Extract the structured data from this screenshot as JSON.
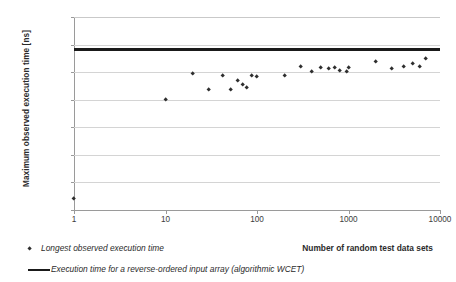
{
  "chart_data": {
    "type": "scatter",
    "title": "",
    "xlabel": "Number of random test data sets",
    "ylabel": "Maximum observed execution time [ns]",
    "xscale": "log",
    "xlim": [
      1,
      10000
    ],
    "ylim": [
      100000,
      240000
    ],
    "ytick_step": 20000,
    "grid": true,
    "legend_position": "bottom-left",
    "xticks": [
      "1",
      "10",
      "100",
      "1000",
      "10000"
    ],
    "xtick_values": [
      1,
      10,
      100,
      1000,
      10000
    ],
    "yticks": [
      "100000",
      "120000",
      "140000",
      "160000",
      "180000",
      "200000",
      "220000",
      "240000"
    ],
    "ytick_values": [
      100000,
      120000,
      140000,
      160000,
      180000,
      200000,
      220000,
      240000
    ],
    "series": [
      {
        "name": "Longest observed execution time",
        "type": "scatter",
        "marker": "diamond",
        "color": "#2e2e2e",
        "points": [
          [
            1,
            108000
          ],
          [
            10,
            179800
          ],
          [
            20,
            198800
          ],
          [
            30,
            187300
          ],
          [
            42,
            197700
          ],
          [
            52,
            187400
          ],
          [
            62,
            193500
          ],
          [
            70,
            191000
          ],
          [
            78,
            188600
          ],
          [
            88,
            197400
          ],
          [
            100,
            196800
          ],
          [
            200,
            197500
          ],
          [
            300,
            203800
          ],
          [
            400,
            200600
          ],
          [
            500,
            203300
          ],
          [
            600,
            202800
          ],
          [
            700,
            203500
          ],
          [
            800,
            201200
          ],
          [
            950,
            200400
          ],
          [
            1000,
            203400
          ],
          [
            2000,
            207500
          ],
          [
            3000,
            202700
          ],
          [
            4000,
            203900
          ],
          [
            5000,
            206200
          ],
          [
            6000,
            203900
          ],
          [
            7000,
            209500
          ]
        ]
      },
      {
        "name": "Execution time for a reverse-ordered input array (algorithmic WCET)",
        "type": "hline",
        "color": "#1a1a1a",
        "value": 216500
      }
    ]
  },
  "legend": {
    "scatter_label": "Longest observed execution time",
    "wcet_label": "Execution time for a reverse-ordered input array (algorithmic WCET)"
  },
  "axes": {
    "x_title": "Number of random test data sets",
    "y_title": "Maximum observed execution time [ns]"
  }
}
